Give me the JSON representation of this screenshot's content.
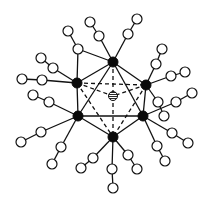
{
  "diagram": {
    "type": "molecular-cluster",
    "colors": {
      "stroke": "#111111",
      "solid": "#0a0a0a",
      "open": "#ffffff",
      "background": "#ffffff"
    },
    "center": {
      "id": "C",
      "x": 113,
      "y": 96,
      "r": 4.5,
      "style": "hatched"
    },
    "core": [
      {
        "id": "T",
        "x": 113,
        "y": 62,
        "r": 5
      },
      {
        "id": "LU",
        "x": 77,
        "y": 83,
        "r": 5
      },
      {
        "id": "RU",
        "x": 146,
        "y": 85,
        "r": 5
      },
      {
        "id": "LL",
        "x": 78,
        "y": 116,
        "r": 5
      },
      {
        "id": "RL",
        "x": 143,
        "y": 116,
        "r": 5
      },
      {
        "id": "B",
        "x": 113,
        "y": 137,
        "r": 5
      }
    ],
    "core_edges_solid": [
      [
        "T",
        "LU"
      ],
      [
        "T",
        "RU"
      ],
      [
        "T",
        "LL"
      ],
      [
        "T",
        "RL"
      ],
      [
        "LU",
        "LL"
      ],
      [
        "RU",
        "RL"
      ],
      [
        "LL",
        "RL"
      ],
      [
        "LL",
        "B"
      ],
      [
        "RL",
        "B"
      ]
    ],
    "core_edges_dashed": [
      [
        "LU",
        "RU"
      ],
      [
        "LU",
        "B"
      ],
      [
        "RU",
        "B"
      ],
      [
        "T",
        "C"
      ],
      [
        "C",
        "B"
      ],
      [
        "LU",
        "C"
      ],
      [
        "RU",
        "C"
      ]
    ],
    "ligands": [
      {
        "anchor": "T",
        "chain": [
          [
            99,
            36
          ],
          [
            90,
            22
          ]
        ]
      },
      {
        "anchor": "T",
        "chain": [
          [
            128,
            34
          ],
          [
            137,
            19
          ]
        ]
      },
      {
        "anchor": "T",
        "chain": [
          [
            78,
            49
          ],
          [
            68,
            31
          ]
        ]
      },
      {
        "anchor": "LU",
        "chain": [
          [
            78,
            49
          ]
        ]
      },
      {
        "anchor": "LU",
        "chain": [
          [
            53,
            68
          ],
          [
            41,
            58
          ]
        ]
      },
      {
        "anchor": "LU",
        "chain": [
          [
            42,
            80
          ],
          [
            22,
            79
          ]
        ]
      },
      {
        "anchor": "RU",
        "chain": [
          [
            156,
            64
          ],
          [
            162,
            49
          ]
        ]
      },
      {
        "anchor": "RU",
        "chain": [
          [
            171,
            76
          ],
          [
            185,
            72
          ]
        ]
      },
      {
        "anchor": "RU",
        "chain": [
          [
            158,
            102
          ],
          [
            164,
            116
          ]
        ]
      },
      {
        "anchor": "RL",
        "chain": [
          [
            176,
            102
          ],
          [
            192,
            93
          ]
        ]
      },
      {
        "anchor": "RL",
        "chain": [
          [
            172,
            133
          ],
          [
            188,
            143
          ]
        ]
      },
      {
        "anchor": "RL",
        "chain": [
          [
            157,
            146
          ],
          [
            165,
            161
          ]
        ]
      },
      {
        "anchor": "B",
        "chain": [
          [
            93,
            158
          ],
          [
            81,
            168
          ]
        ]
      },
      {
        "anchor": "B",
        "chain": [
          [
            112,
            169
          ],
          [
            113,
            188
          ]
        ]
      },
      {
        "anchor": "B",
        "chain": [
          [
            128,
            155
          ],
          [
            137,
            169
          ]
        ]
      },
      {
        "anchor": "LL",
        "chain": [
          [
            49,
            102
          ],
          [
            33,
            95
          ]
        ]
      },
      {
        "anchor": "LL",
        "chain": [
          [
            41,
            132
          ],
          [
            21,
            142
          ]
        ]
      },
      {
        "anchor": "LL",
        "chain": [
          [
            61,
            147
          ],
          [
            52,
            164
          ]
        ]
      }
    ],
    "ligand_atom_radius": 5
  }
}
